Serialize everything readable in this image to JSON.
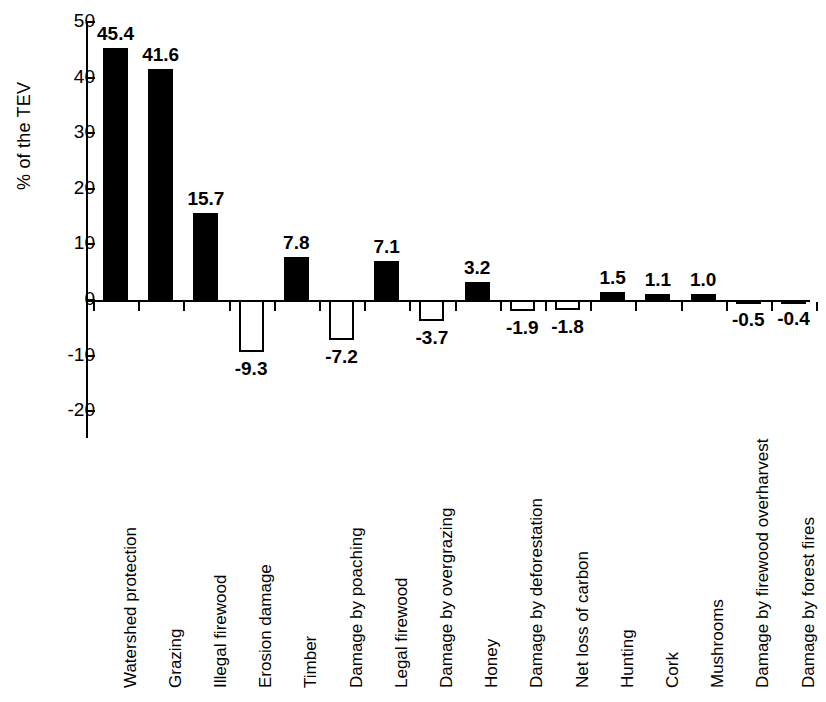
{
  "chart_data": {
    "type": "bar",
    "title": "",
    "xlabel": "",
    "ylabel": "% of the TEV",
    "ylim": [
      -20,
      50
    ],
    "yticks": [
      50,
      40,
      30,
      20,
      10,
      0,
      -10,
      -20
    ],
    "ytick_labels": [
      "50",
      "40",
      "30",
      "20",
      "10",
      "0",
      "-10",
      "-20"
    ],
    "grid": false,
    "legend": null,
    "categories": [
      "Watershed protection",
      "Grazing",
      "Illegal firewood",
      "Erosion damage",
      "Timber",
      "Damage by poaching",
      "Legal firewood",
      "Damage by overgrazing",
      "Honey",
      "Damage by deforestation",
      "Net loss of carbon",
      "Hunting",
      "Cork",
      "Mushrooms",
      "Damage by firewood overharvest",
      "Damage by forest fires"
    ],
    "values": [
      45.4,
      41.6,
      15.7,
      -9.3,
      7.8,
      -7.2,
      7.1,
      -3.7,
      3.2,
      -1.9,
      -1.8,
      1.5,
      1.1,
      1.0,
      -0.5,
      -0.4
    ],
    "value_labels": [
      "45.4",
      "41.6",
      "15.7",
      "-9.3",
      "7.8",
      "-7.2",
      "7.1",
      "-3.7",
      "3.2",
      "-1.9",
      "-1.8",
      "1.5",
      "1.1",
      "1.0",
      "-0.5",
      "-0.4"
    ],
    "colors": {
      "positive_fill": "#000000",
      "negative_fill": "#ffffff",
      "bar_stroke": "#000000",
      "axis": "#000000",
      "background": "#ffffff"
    }
  }
}
